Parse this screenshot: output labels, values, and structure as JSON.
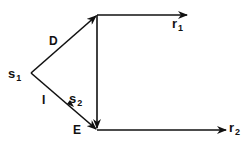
{
  "diagram": {
    "nodes": {
      "s1": {
        "label": "s",
        "sub": "1"
      },
      "s2": {
        "label": "s",
        "sub": "2"
      },
      "r1": {
        "label": "r",
        "sub": "1"
      },
      "r2": {
        "label": "r",
        "sub": "2"
      }
    },
    "edge_labels": {
      "D": "D",
      "I": "I",
      "E": "E"
    },
    "edges": [
      {
        "from": "s1",
        "to": "top-corner",
        "label": "D"
      },
      {
        "from": "s1",
        "to": "bottom-corner",
        "label": "I"
      },
      {
        "from": "top-corner",
        "to": "r1"
      },
      {
        "from": "top-corner",
        "to": "bottom-corner"
      },
      {
        "from": "bottom-corner",
        "to": "r2"
      }
    ],
    "colors": {
      "line": "#111111",
      "background": "#ffffff"
    }
  }
}
